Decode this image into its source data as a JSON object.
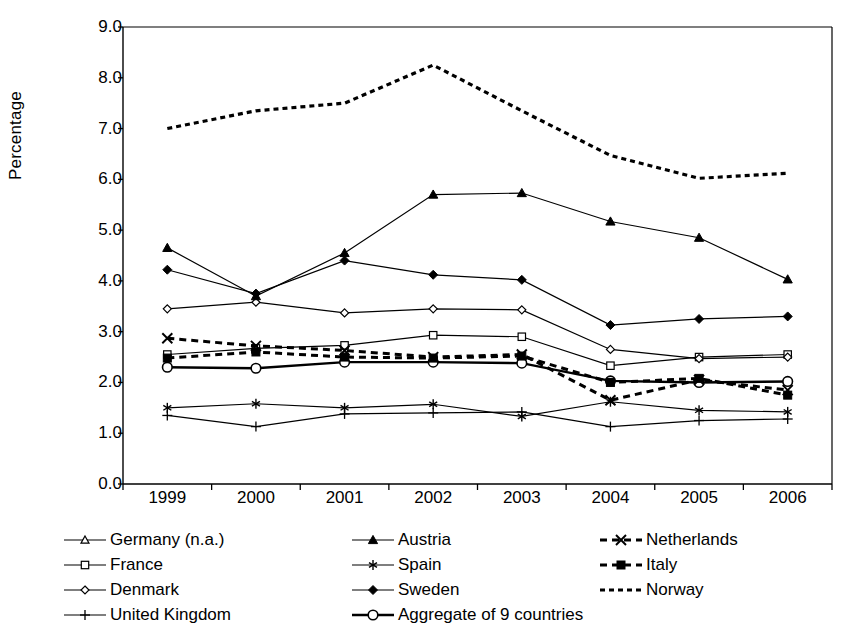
{
  "chart_data": {
    "type": "line",
    "title": "",
    "subtitle": "",
    "xlabel": "",
    "ylabel": "Percentage",
    "categories": [
      "1999",
      "2000",
      "2001",
      "2002",
      "2003",
      "2004",
      "2005",
      "2006"
    ],
    "x": [
      1999,
      2000,
      2001,
      2002,
      2003,
      2004,
      2005,
      2006
    ],
    "ylim": [
      0.0,
      9.0
    ],
    "ytick_labels": [
      "0.0",
      "1.0",
      "2.0",
      "3.0",
      "4.0",
      "5.0",
      "6.0",
      "7.0",
      "8.0",
      "9.0"
    ],
    "ytick_values": [
      0.0,
      1.0,
      2.0,
      3.0,
      4.0,
      5.0,
      6.0,
      7.0,
      8.0,
      9.0
    ],
    "grid": false,
    "legend_position": "bottom",
    "series": [
      {
        "name": "Germany (n.a.)",
        "marker": "triangle-open",
        "linestyle": "solid",
        "values": [
          null,
          null,
          null,
          null,
          null,
          null,
          null,
          null
        ]
      },
      {
        "name": "France",
        "marker": "square-open",
        "linestyle": "solid",
        "values": [
          2.55,
          2.67,
          2.73,
          2.93,
          2.9,
          2.33,
          2.5,
          2.55
        ]
      },
      {
        "name": "Denmark",
        "marker": "diamond-open",
        "linestyle": "solid",
        "values": [
          3.45,
          3.58,
          3.37,
          3.45,
          3.43,
          2.65,
          2.47,
          2.5
        ]
      },
      {
        "name": "United Kingdom",
        "marker": "plus",
        "linestyle": "solid",
        "values": [
          1.35,
          1.13,
          1.38,
          1.4,
          1.42,
          1.13,
          1.25,
          1.28
        ]
      },
      {
        "name": "Austria",
        "marker": "triangle-filled",
        "linestyle": "solid",
        "values": [
          4.65,
          3.7,
          4.55,
          5.7,
          5.73,
          5.17,
          4.85,
          4.03
        ]
      },
      {
        "name": "Spain",
        "marker": "asterisk",
        "linestyle": "solid",
        "values": [
          1.5,
          1.58,
          1.5,
          1.57,
          1.33,
          1.62,
          1.45,
          1.42
        ]
      },
      {
        "name": "Sweden",
        "marker": "diamond-filled",
        "linestyle": "solid",
        "values": [
          4.22,
          3.75,
          4.4,
          4.12,
          4.02,
          3.13,
          3.25,
          3.3
        ]
      },
      {
        "name": "Aggregate of 9 countries",
        "marker": "circle-open",
        "linestyle": "solid-thick",
        "values": [
          2.3,
          2.28,
          2.4,
          2.4,
          2.38,
          2.03,
          2.0,
          2.02
        ]
      },
      {
        "name": "Netherlands",
        "marker": "x-cross",
        "linestyle": "dashed",
        "values": [
          2.87,
          2.72,
          2.63,
          2.5,
          2.55,
          1.65,
          2.05,
          1.85
        ]
      },
      {
        "name": "Italy",
        "marker": "square-filled",
        "linestyle": "dashed",
        "values": [
          2.48,
          2.6,
          2.5,
          2.48,
          2.52,
          2.0,
          2.08,
          1.75
        ]
      },
      {
        "name": "Norway",
        "marker": "none",
        "linestyle": "dotted",
        "values": [
          7.0,
          7.35,
          7.5,
          8.25,
          7.35,
          6.47,
          6.02,
          6.12
        ]
      }
    ]
  },
  "axis": {
    "ylabel": "Percentage",
    "ytick_labels": [
      "9.0",
      "8.0",
      "7.0",
      "6.0",
      "5.0",
      "4.0",
      "3.0",
      "2.0",
      "1.0",
      "0.0"
    ],
    "xtick_labels": [
      "1999",
      "2000",
      "2001",
      "2002",
      "2003",
      "2004",
      "2005",
      "2006"
    ]
  },
  "legend": {
    "rows": [
      [
        {
          "label": "Germany (n.a.)",
          "key": "triangle-open-solid"
        },
        {
          "label": "Austria",
          "key": "triangle-filled-solid"
        },
        {
          "label": "Netherlands",
          "key": "x-cross-dashed"
        }
      ],
      [
        {
          "label": "France",
          "key": "square-open-solid"
        },
        {
          "label": "Spain",
          "key": "asterisk-solid"
        },
        {
          "label": "Italy",
          "key": "square-filled-dashed"
        }
      ],
      [
        {
          "label": "Denmark",
          "key": "diamond-open-solid"
        },
        {
          "label": "Sweden",
          "key": "diamond-filled-solid"
        },
        {
          "label": "Norway",
          "key": "dotted"
        }
      ],
      [
        {
          "label": "United Kingdom",
          "key": "plus-solid"
        },
        {
          "label": "Aggregate of 9 countries",
          "key": "circle-open-thick"
        }
      ]
    ]
  },
  "colors": {
    "line": "#000000",
    "axis": "#000000",
    "background": "#ffffff"
  }
}
